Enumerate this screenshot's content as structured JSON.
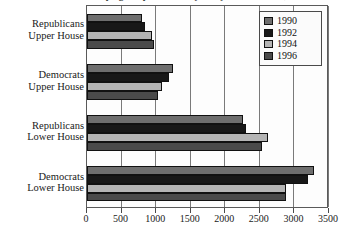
{
  "chart_data": {
    "type": "bar",
    "orientation": "horizontal",
    "title": "Campaign Expenditures by Party and Chamber, 1990 to 1996",
    "xlabel": "",
    "ylabel": "",
    "xlim": [
      0,
      3500
    ],
    "xticks": [
      0,
      500,
      1000,
      1500,
      2000,
      2500,
      3000,
      3500
    ],
    "grid": true,
    "legend_position": "top-right",
    "categories": [
      "Republicans Upper House",
      "Democrats Upper House",
      "Republicans Lower House",
      "Democrats Lower House"
    ],
    "category_lines": [
      [
        "Republicans",
        "Upper House"
      ],
      [
        "Democrats",
        "Upper House"
      ],
      [
        "Republicans",
        "Lower House"
      ],
      [
        "Democrats",
        "Lower House"
      ]
    ],
    "series": [
      {
        "name": "1990",
        "color": "#6e6e6e",
        "values": [
          790,
          1250,
          2250,
          3280
        ]
      },
      {
        "name": "1992",
        "color": "#181818",
        "values": [
          840,
          1190,
          2300,
          3200
        ]
      },
      {
        "name": "1994",
        "color": "#b4b4b4",
        "values": [
          940,
          1080,
          2620,
          2880
        ]
      },
      {
        "name": "1996",
        "color": "#4a4a4a",
        "values": [
          970,
          1020,
          2530,
          2880
        ]
      }
    ]
  },
  "legend": {
    "items": [
      {
        "label": "1990",
        "color": "#6e6e6e"
      },
      {
        "label": "1992",
        "color": "#181818"
      },
      {
        "label": "1994",
        "color": "#b4b4b4"
      },
      {
        "label": "1996",
        "color": "#4a4a4a"
      }
    ]
  }
}
